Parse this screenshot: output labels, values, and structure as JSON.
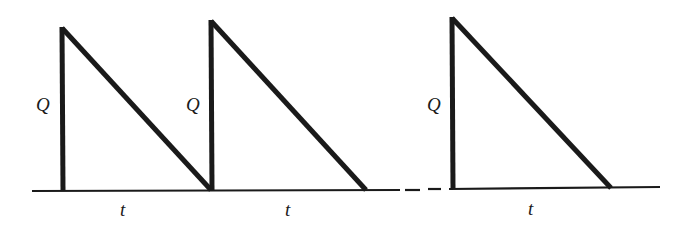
{
  "diagram": {
    "type": "sawtooth-waveform",
    "line_color": "#1a1a1a",
    "background": "#ffffff",
    "pulses": [
      {
        "amplitude_label": "Q",
        "duration_label": "t"
      },
      {
        "amplitude_label": "Q",
        "duration_label": "t"
      },
      {
        "amplitude_label": "Q",
        "duration_label": "t"
      }
    ],
    "break_between": [
      2,
      3
    ]
  }
}
